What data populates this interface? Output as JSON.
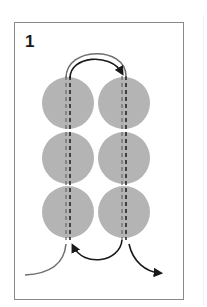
{
  "step": {
    "number": "1"
  },
  "diagram": {
    "colors": {
      "bead": "#b4b4b4",
      "thread_primary": "#1a1a1a",
      "thread_secondary": "#7a7a7a",
      "frame": "#8a8a8a"
    },
    "beads": [
      {
        "column": "left",
        "row": 1,
        "cx": 68,
        "cy": 103,
        "r": 26
      },
      {
        "column": "left",
        "row": 2,
        "cx": 68,
        "cy": 158,
        "r": 26
      },
      {
        "column": "left",
        "row": 3,
        "cx": 68,
        "cy": 212,
        "r": 26
      },
      {
        "column": "right",
        "row": 1,
        "cx": 124,
        "cy": 103,
        "r": 26
      },
      {
        "column": "right",
        "row": 2,
        "cx": 124,
        "cy": 158,
        "r": 26
      },
      {
        "column": "right",
        "row": 3,
        "cx": 124,
        "cy": 212,
        "r": 26
      }
    ],
    "arrows": [
      {
        "name": "top-arc-arrow",
        "direction": "left-to-right"
      },
      {
        "name": "bottom-return-arrow",
        "direction": "right-to-left"
      },
      {
        "name": "exit-arrow",
        "direction": "down-right"
      }
    ]
  }
}
